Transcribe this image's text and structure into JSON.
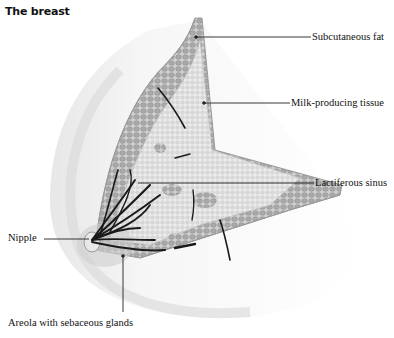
{
  "title": "The breast",
  "labels": {
    "subcutaneous_fat": "Subcutaneous fat",
    "milk_producing_tissue": "Milk-producing tissue",
    "lactiferous_sinus": "Lactiferous sinus",
    "nipple": "Nipple",
    "areola": "Areola with sebaceous glands"
  },
  "colors": {
    "background": "#ffffff",
    "skin_shade": "#e6e6e6",
    "fat_tissue": "#b8b8b8",
    "glandular_tissue": "#dcdcdc",
    "ducts": "#1a1a1a",
    "leader_lines": "#222222"
  }
}
